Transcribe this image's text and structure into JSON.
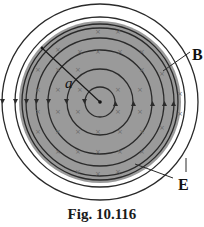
{
  "figure": {
    "caption": "Fig. 10.116",
    "labels": {
      "radius": "a",
      "magnetic_field": "B",
      "electric_field": "E"
    },
    "center": [
      100,
      102
    ],
    "disk_radius": 80,
    "outer_circle_radii": [
      98,
      85
    ],
    "field_circle_radii": [
      15,
      33,
      52,
      64,
      74
    ],
    "colors": {
      "disk": "#9a9a9a",
      "line": "#2a2a2a",
      "background": "#ffffff"
    },
    "cross_marker": "×"
  }
}
